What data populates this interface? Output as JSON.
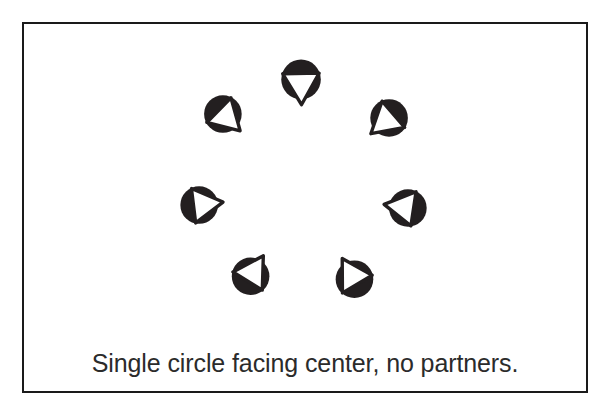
{
  "figure": {
    "title_caption": "Single circle facing center, no partners.",
    "frame": {
      "border_color": "#1a1a1a",
      "background_color": "#ffffff",
      "border_width_px": 2
    },
    "palette": {
      "shape_fill": "#231f20",
      "triangle_fill": "#ffffff",
      "triangle_stroke": "#231f20",
      "caption_color": "#2b2b2b"
    },
    "arrangement": {
      "description": "Seven filled circles arranged in a ring, each bearing a white outlined triangle pointing inward toward the ring center.",
      "count": 7,
      "ring_center_x": 303,
      "ring_center_y": 192,
      "ring_radius": 114,
      "circle_radius": 20
    },
    "shapes": [
      {
        "id": "shape-top",
        "label": "circle-facing-center-top",
        "cx": 301,
        "cy": 78,
        "r": 20,
        "angle_deg": 90,
        "facing": "down"
      },
      {
        "id": "shape-upper-right",
        "label": "circle-facing-center-upper-right",
        "cx": 390,
        "cy": 117,
        "r": 19,
        "angle_deg": 143,
        "facing": "down-left"
      },
      {
        "id": "shape-right",
        "label": "circle-facing-center-right",
        "cx": 409,
        "cy": 208,
        "r": 19,
        "angle_deg": 193,
        "facing": "left"
      },
      {
        "id": "shape-lower-right",
        "label": "circle-facing-center-lower-right",
        "cx": 355,
        "cy": 280,
        "r": 19,
        "angle_deg": 239,
        "facing": "up-left"
      },
      {
        "id": "shape-lower-left",
        "label": "circle-facing-center-lower-left",
        "cx": 250,
        "cy": 277,
        "r": 19,
        "angle_deg": 300,
        "facing": "up-right"
      },
      {
        "id": "shape-left",
        "label": "circle-facing-center-left",
        "cx": 198,
        "cy": 205,
        "r": 19,
        "angle_deg": 353,
        "facing": "right"
      },
      {
        "id": "shape-upper-left",
        "label": "circle-facing-center-upper-left",
        "cx": 222,
        "cy": 113,
        "r": 19,
        "angle_deg": 42,
        "facing": "down-right"
      }
    ]
  }
}
